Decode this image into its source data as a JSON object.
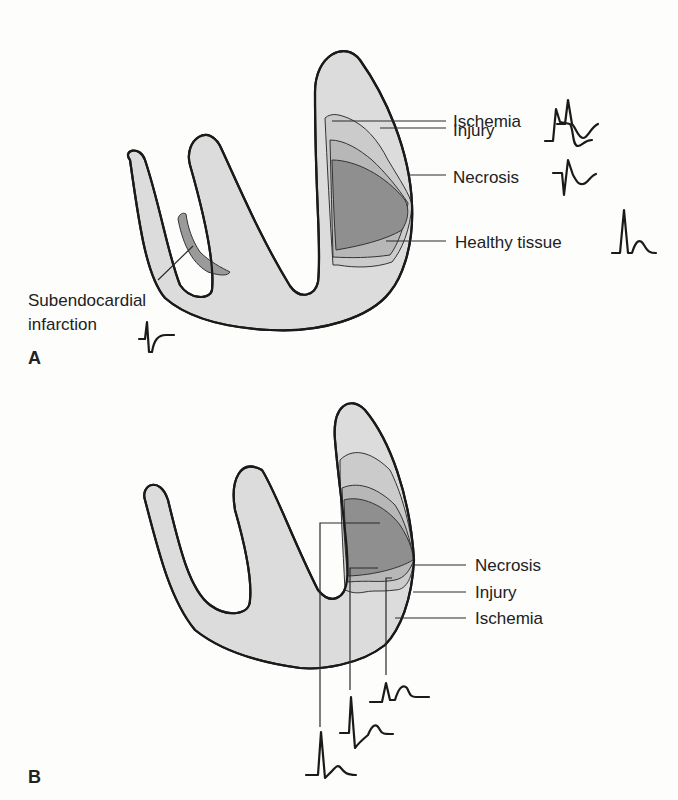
{
  "figure": {
    "panels": [
      {
        "id": "A",
        "label": "A",
        "zones": {
          "ischemia": "Ischemia",
          "injury": "Injury",
          "necrosis": "Necrosis",
          "healthy": "Healthy tissue"
        },
        "subendocardial": {
          "line1": "Subendocardial",
          "line2": "infarction"
        }
      },
      {
        "id": "B",
        "label": "B",
        "zones": {
          "necrosis": "Necrosis",
          "injury": "Injury",
          "ischemia": "Ischemia"
        }
      }
    ],
    "colors": {
      "background": "#fdfdfc",
      "healthy_tissue": "#dcdcdc",
      "ischemia": "#cbcbcb",
      "injury": "#b7b7b7",
      "necrosis": "#8f8f8f",
      "outline": "#1a1a1a"
    }
  }
}
